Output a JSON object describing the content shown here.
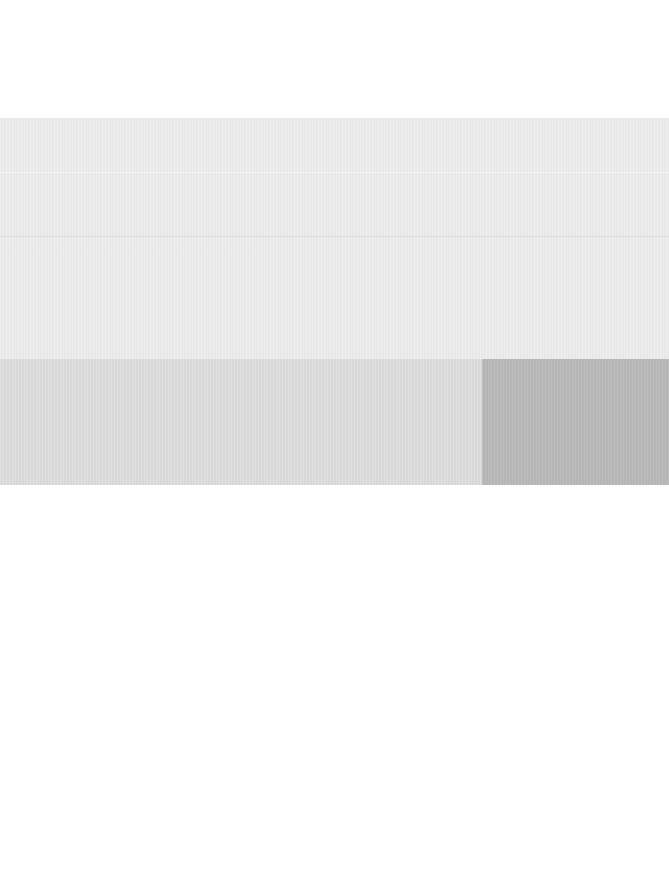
{
  "screen": {
    "width": 669,
    "height": 889,
    "state": "blank / content not rendered"
  },
  "colors": {
    "background": "#ffffff",
    "panel": "#ececec",
    "panel_divider": "#dcdcdc",
    "strip": "#dcdcdc",
    "strip_block": "#b9b9b9"
  },
  "header": {
    "text": ""
  },
  "panel": {
    "rows": [
      {
        "text": ""
      },
      {
        "text": ""
      },
      {
        "text": ""
      }
    ]
  },
  "strip": {
    "left": {
      "text": ""
    },
    "right": {
      "text": ""
    }
  },
  "content": {
    "text": ""
  }
}
